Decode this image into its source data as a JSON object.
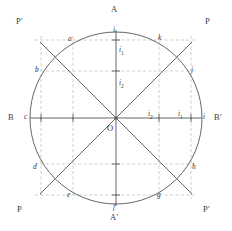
{
  "figure": {
    "type": "geometric-construction",
    "colors": {
      "background": "#ffffff",
      "solid_line": "#555555",
      "dashed_line": "#b9b9b9",
      "label": "#3a3a3a"
    }
  },
  "axis_labels": {
    "top": "A",
    "bottom": "A'",
    "left": "B",
    "right": "B'",
    "diagonal_top_left": "P'",
    "diagonal_top_right": "P",
    "diagonal_bottom_left": "P",
    "diagonal_bottom_right": "P'"
  },
  "center_label": "O",
  "circle_points": [
    {
      "id": "point-i-top",
      "label": "i",
      "x": 116,
      "y": 30,
      "lx": 113,
      "ly": 26
    },
    {
      "id": "point-a",
      "label": "a",
      "x": 73,
      "y": 40,
      "lx": 68,
      "ly": 35
    },
    {
      "id": "point-k",
      "label": "k",
      "x": 159,
      "y": 40,
      "lx": 158,
      "ly": 34
    },
    {
      "id": "point-b",
      "label": "b",
      "x": 41,
      "y": 71,
      "lx": 35,
      "ly": 66
    },
    {
      "id": "point-j",
      "label": "j",
      "x": 191,
      "y": 71,
      "lx": 191,
      "ly": 66
    },
    {
      "id": "point-c",
      "label": "c",
      "x": 30,
      "y": 118,
      "lx": 24,
      "ly": 113
    },
    {
      "id": "point-i-right",
      "label": "i",
      "x": 202,
      "y": 118,
      "lx": 203,
      "ly": 113
    },
    {
      "id": "point-d",
      "label": "d",
      "x": 41,
      "y": 164,
      "lx": 33,
      "ly": 163
    },
    {
      "id": "point-h",
      "label": "h",
      "x": 191,
      "y": 164,
      "lx": 192,
      "ly": 163
    },
    {
      "id": "point-e",
      "label": "e",
      "x": 73,
      "y": 195,
      "lx": 67,
      "ly": 191
    },
    {
      "id": "point-g",
      "label": "g",
      "x": 159,
      "y": 195,
      "lx": 157,
      "ly": 191
    },
    {
      "id": "point-f",
      "label": "f",
      "x": 116,
      "y": 206,
      "lx": 113,
      "ly": 203
    }
  ],
  "interval_labels": [
    {
      "id": "i1-vertical",
      "text": "i",
      "sub": "1",
      "lx": 119,
      "ly": 46
    },
    {
      "id": "i2-vertical",
      "text": "i",
      "sub": "2",
      "lx": 119,
      "ly": 79
    },
    {
      "id": "i2-horizontal",
      "text": "i",
      "sub": "2",
      "lx": 148,
      "ly": 110
    },
    {
      "id": "i1-horizontal",
      "text": "i",
      "sub": "1",
      "lx": 178,
      "ly": 110
    }
  ],
  "geometry": {
    "center_x": 116,
    "center_y": 118,
    "radius": 86,
    "dashed_v_x": [
      41,
      73,
      159,
      191
    ],
    "dashed_h_y": [
      40,
      71,
      164,
      195
    ],
    "axis_extent": 88,
    "diagonal_extent": 108
  }
}
